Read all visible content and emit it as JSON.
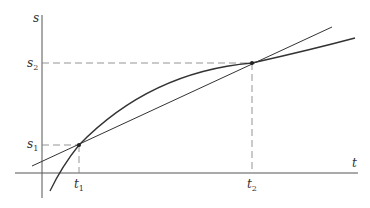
{
  "diagram": {
    "axes": {
      "vertical_label": "s",
      "horizontal_label": "t"
    },
    "points": [
      {
        "t_label": "t",
        "t_sub": "1",
        "s_label": "s",
        "s_sub": "1"
      },
      {
        "t_label": "t",
        "t_sub": "2",
        "s_label": "s",
        "s_sub": "2"
      }
    ],
    "elements": [
      "curve",
      "secant-line",
      "dashed-guides"
    ],
    "colors": {
      "line": "#333333",
      "dashed": "#888888"
    }
  }
}
